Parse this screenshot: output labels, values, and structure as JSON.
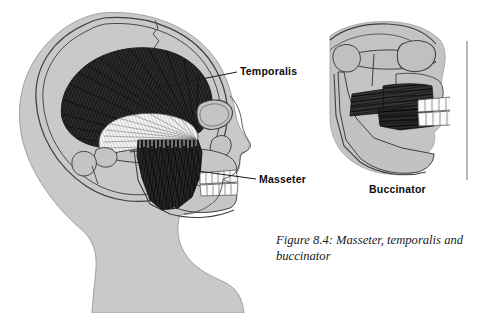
{
  "figure": {
    "caption": "Figure 8.4: Masseter, temporalis and buccinator",
    "caption_line1": "Figure 8.4: Masseter, temporalis",
    "caption_line2": "and buccinator",
    "number": "8.4"
  },
  "labels": {
    "temporalis": "Temporalis",
    "masseter": "Masseter",
    "buccinator": "Buccinator"
  },
  "colors": {
    "background": "#ffffff",
    "skin_fill": "#c9c9c9",
    "skull_fill": "#bcbcbc",
    "bone_outline": "#3b3b3b",
    "muscle_dark": "#2b2b2b",
    "muscle_fiber": "#111111",
    "muscle_light": "#f2f2f2",
    "tooth_fill": "#fbfbfb",
    "tooth_outline": "#555555",
    "leader_line": "#1a1a1a",
    "label_text": "#0d0d0d",
    "caption_text": "#1a1a1a",
    "rule_line": "#8a8a8a"
  },
  "panels": {
    "main": {
      "name": "lateral-skull-view",
      "description": "Lateral view of head showing temporalis and masseter muscles"
    },
    "inset": {
      "name": "buccinator-inset-view",
      "description": "Lateral partial skull showing buccinator muscle",
      "title": "Buccinator"
    }
  },
  "annotations": [
    {
      "id": "temporalis",
      "label": "Temporalis",
      "leader_from": [
        156,
        88
      ],
      "leader_to": [
        237,
        72
      ]
    },
    {
      "id": "masseter",
      "label": "Masseter",
      "leader_from": [
        176,
        168
      ],
      "leader_to": [
        256,
        179
      ]
    }
  ]
}
